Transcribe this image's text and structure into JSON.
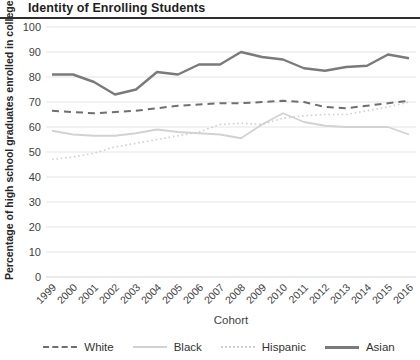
{
  "header": {
    "title": "Identity of Enrolling Students"
  },
  "colors": {
    "background": "#ffffff",
    "title_text": "#1f1f1f",
    "axis_text": "#3f3f3f",
    "title_rule": "#2e2e2e",
    "gridline": "#e4e4e4",
    "baseline": "#d6d6d6",
    "dark_series": "#767676",
    "light_series": "#d2d2d2"
  },
  "chart_data": {
    "type": "line",
    "title": "Identity of Enrolling Students",
    "xlabel": "Cohort",
    "ylabel": "Percentage of high school graduates enrolled in college",
    "ylim": [
      0,
      100
    ],
    "yticks": [
      100,
      90,
      80,
      70,
      60,
      50,
      40,
      30,
      20,
      10,
      0
    ],
    "grid": true,
    "legend_position": "bottom",
    "categories": [
      "1999",
      "2000",
      "2001",
      "2002",
      "2003",
      "2004",
      "2005",
      "2006",
      "2007",
      "2008",
      "2009",
      "2010",
      "2011",
      "2012",
      "2013",
      "2014",
      "2015",
      "2016"
    ],
    "series": [
      {
        "name": "White",
        "style": "dashed",
        "color": "#6f6f6f",
        "values": [
          66.5,
          66,
          65.5,
          66,
          66.5,
          67.5,
          68.5,
          69,
          69.5,
          69.5,
          70,
          70.5,
          70,
          68,
          67.5,
          68.5,
          69.5,
          70.5
        ]
      },
      {
        "name": "Black",
        "style": "solid",
        "color": "#d2d2d2",
        "values": [
          58.5,
          57,
          56.5,
          56.5,
          57.5,
          59,
          58,
          57.5,
          57,
          55.5,
          61,
          65.5,
          62,
          60.5,
          60,
          60,
          60,
          57
        ]
      },
      {
        "name": "Hispanic",
        "style": "dotted",
        "color": "#cfcfcf",
        "values": [
          47,
          48,
          49.5,
          52,
          53.5,
          55,
          56.5,
          58,
          61,
          61.5,
          61,
          63.5,
          64.5,
          65,
          65,
          66.5,
          68,
          70
        ]
      },
      {
        "name": "Asian",
        "style": "solid-bold",
        "color": "#7a7a7a",
        "values": [
          81,
          81,
          78,
          73,
          75,
          82,
          81,
          85,
          85,
          90,
          88,
          87,
          83.5,
          82.5,
          84,
          84.5,
          89,
          87.5
        ]
      }
    ]
  }
}
